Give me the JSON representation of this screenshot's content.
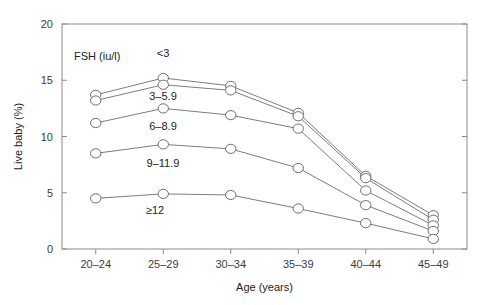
{
  "chart_data": {
    "type": "line",
    "title": "",
    "xlabel": "Age (years)",
    "ylabel": "Live baby (%)",
    "legend_title": "FSH (iu/l)",
    "legend_position": "inline-labels",
    "grid": false,
    "categories": [
      "20–24",
      "25–29",
      "30–34",
      "35–39",
      "40–44",
      "45–49"
    ],
    "ylim": [
      0,
      20
    ],
    "yticks": [
      0,
      5,
      10,
      15,
      20
    ],
    "ytick_labels": [
      "0",
      "5",
      "10",
      "15",
      "20"
    ],
    "series": [
      {
        "name": "<3",
        "values": [
          13.7,
          15.2,
          14.5,
          12.1,
          6.5,
          3.0
        ]
      },
      {
        "name": "3–5.9",
        "values": [
          13.2,
          14.6,
          14.1,
          11.8,
          6.3,
          2.6
        ]
      },
      {
        "name": "6–8.9",
        "values": [
          11.2,
          12.5,
          11.9,
          10.7,
          5.2,
          2.1
        ]
      },
      {
        "name": "9–11.9",
        "values": [
          8.5,
          9.3,
          8.9,
          7.2,
          3.9,
          1.6
        ]
      },
      {
        "name": "≥12",
        "values": [
          4.5,
          4.9,
          4.8,
          3.6,
          2.3,
          0.9
        ]
      }
    ]
  }
}
